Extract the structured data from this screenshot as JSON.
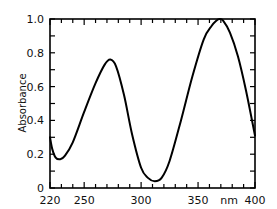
{
  "chart_data": {
    "type": "line",
    "title": "",
    "xlabel": "nm",
    "ylabel": "Absorbance",
    "xlim": [
      220,
      400
    ],
    "ylim": [
      0,
      1.0
    ],
    "grid": false,
    "legend": null,
    "x_ticks": [
      220,
      250,
      300,
      350,
      400
    ],
    "x_tick_labels": [
      "220",
      "250",
      "300",
      "350",
      "400"
    ],
    "x_minor_tick_step": 10,
    "y_ticks": [
      0,
      0.2,
      0.4,
      0.6,
      0.8,
      1.0
    ],
    "y_tick_labels": [
      "0",
      "0.2",
      "0.4",
      "0.6",
      "0.8",
      "1.0"
    ],
    "y_minor_tick_step": 0.1,
    "series": [
      {
        "name": "Absorbance spectrum",
        "color": "#000000",
        "x": [
          220,
          222,
          225,
          229,
          233,
          240,
          250,
          260,
          268,
          273,
          278,
          285,
          292,
          300,
          306,
          312,
          318,
          325,
          335,
          345,
          355,
          362,
          366,
          369,
          372,
          378,
          385,
          392,
          400
        ],
        "values": [
          0.3,
          0.23,
          0.18,
          0.17,
          0.19,
          0.27,
          0.45,
          0.62,
          0.73,
          0.76,
          0.72,
          0.55,
          0.32,
          0.12,
          0.06,
          0.04,
          0.06,
          0.16,
          0.4,
          0.66,
          0.88,
          0.96,
          0.99,
          1.0,
          0.99,
          0.92,
          0.78,
          0.58,
          0.31
        ]
      }
    ],
    "annotations": [
      {
        "text": "nm",
        "position": "x-axis, between 350 and 400"
      }
    ]
  }
}
